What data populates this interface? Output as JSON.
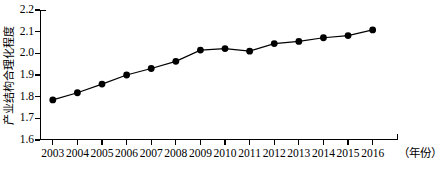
{
  "chart_data": {
    "type": "line",
    "title": "",
    "xlabel": "（年份）",
    "ylabel": "产业结构合理化程度",
    "categories": [
      "2003",
      "2004",
      "2005",
      "2006",
      "2007",
      "2008",
      "2009",
      "2010",
      "2011",
      "2012",
      "2013",
      "2014",
      "2015",
      "2016"
    ],
    "values": [
      1.785,
      1.818,
      1.858,
      1.9,
      1.93,
      1.963,
      2.015,
      2.022,
      2.01,
      2.045,
      2.055,
      2.072,
      2.082,
      2.108
    ],
    "series": [
      {
        "name": "产业结构合理化程度",
        "values": [
          1.785,
          1.818,
          1.858,
          1.9,
          1.93,
          1.963,
          2.015,
          2.022,
          2.01,
          2.045,
          2.055,
          2.072,
          2.082,
          2.108
        ]
      }
    ],
    "ylim": [
      1.6,
      2.2
    ],
    "yticks": [
      1.6,
      1.7,
      1.8,
      1.9,
      2.0,
      2.1,
      2.2
    ],
    "ytick_labels": [
      "1.6",
      "1.7",
      "1.8",
      "1.9",
      "2.0",
      "2.1",
      "2.2"
    ],
    "grid": false,
    "legend": false,
    "legend_position": "none",
    "marker": "filled-circle",
    "line_color": "#000000",
    "marker_color": "#000000",
    "background_color": "#ffffff"
  },
  "axes": {
    "y_title": "产业结构合理化程度",
    "x_title": "（年份）"
  }
}
